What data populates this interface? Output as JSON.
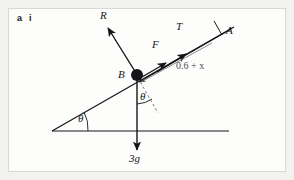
{
  "question": {
    "part_letter": "a",
    "part_roman": "i"
  },
  "diagram": {
    "type": "free-body-diagram-inclined-plane",
    "labels": {
      "normal_reaction": "R",
      "friction": "F",
      "tension": "T",
      "point_a": "A",
      "point_b": "B",
      "distance": "0.6 + x",
      "weight": "3g",
      "incline_angle": "θ",
      "vertical_angle": "θ"
    },
    "colors": {
      "ink": "#16161a",
      "light_ink": "#4a4a50",
      "frame": "#d8d8d4",
      "page_background": "#f2f2f0",
      "panel": "#fdfdfc"
    },
    "geometry": {
      "incline_angle_degrees": 27,
      "particle_b": {
        "x": 137,
        "y": 75
      },
      "point_a": {
        "x": 222,
        "y": 32
      },
      "incline_base_left": {
        "x": 52,
        "y": 131
      },
      "ground_right": {
        "x": 229,
        "y": 131
      }
    },
    "forces": [
      {
        "name": "R",
        "description": "normal reaction perpendicular to incline, up-left from B"
      },
      {
        "name": "F",
        "description": "friction up the incline from B toward A"
      },
      {
        "name": "T",
        "description": "tension up the incline toward A"
      },
      {
        "name": "3g",
        "description": "weight acting vertically downward from B"
      }
    ]
  }
}
